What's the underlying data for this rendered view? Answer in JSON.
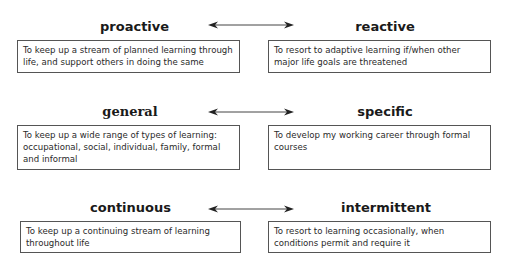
{
  "rows": [
    {
      "left": {
        "title": "proactive",
        "description": "To keep up a stream of planned learning through life, and support others in doing the same"
      },
      "right": {
        "title": "reactive",
        "description": "To resort to adaptive learning if/when other major life goals are threatened"
      }
    },
    {
      "left": {
        "title": "general",
        "description": "To keep up a wide range of types of learning: occupational, social, individual, family, formal and informal"
      },
      "right": {
        "title": "specific",
        "description": "To develop my working career through formal courses"
      }
    },
    {
      "left": {
        "title": "continuous",
        "description": "To keep up a continuing stream of learning throughout life"
      },
      "right": {
        "title": "intermittent",
        "description": "To resort to learning occasionally, when conditions permit and require it"
      }
    }
  ],
  "connector": {
    "type": "double-headed-arrow",
    "color": "#333333"
  }
}
